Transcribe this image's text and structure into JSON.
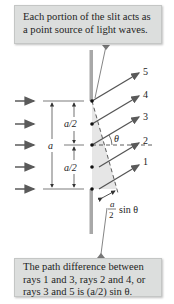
{
  "top_callout": {
    "lines": [
      "Each portion of the slit acts as",
      "a point source of light waves."
    ]
  },
  "bottom_callout": {
    "lines": [
      "The path difference between",
      "rays 1 and 3, rays 2 and 4, or",
      "rays 3 and 5 is (a/2) sin θ."
    ]
  },
  "diagram": {
    "ray_labels": [
      "5",
      "4",
      "3",
      "2",
      "1"
    ],
    "angle_label": "θ",
    "slit_width_label": "a",
    "half_width_label_upper": "a/2",
    "half_width_label_lower": "a/2",
    "path_diff_label_numerator": "a",
    "path_diff_label_denominator": "2",
    "path_diff_label_suffix": "sin θ",
    "incident_arrow_count": 5
  },
  "colors": {
    "callout_bg": "#dcdedd",
    "ray_color": "#555555",
    "slit_color": "#a8a8a8",
    "wedge_fill": "#e6e6e6",
    "text_color": "#1e1e1e"
  }
}
